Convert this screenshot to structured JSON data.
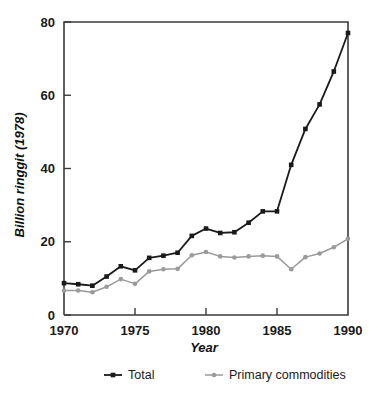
{
  "chart_data": {
    "type": "line",
    "title": "",
    "subtitle": "",
    "xlabel": "Year",
    "ylabel": "Billion ringgit (1978)",
    "xlim": [
      1970,
      1990
    ],
    "ylim": [
      0,
      80
    ],
    "xticks": [
      1970,
      1975,
      1980,
      1985,
      1990
    ],
    "yticks": [
      0,
      20,
      40,
      60,
      80
    ],
    "xtick_labels": [
      "1970",
      "1975",
      "1980",
      "1985",
      "1990"
    ],
    "ytick_labels": [
      "0",
      "20",
      "40",
      "60",
      "80"
    ],
    "grid": false,
    "legend_position": "bottom",
    "x": [
      1970,
      1971,
      1972,
      1973,
      1974,
      1975,
      1976,
      1977,
      1978,
      1979,
      1980,
      1981,
      1982,
      1983,
      1984,
      1985,
      1986,
      1987,
      1988,
      1989,
      1990
    ],
    "series": [
      {
        "name": "Total",
        "color": "#1a1a1a",
        "marker": "square",
        "values": [
          8.7,
          8.4,
          8.0,
          10.5,
          13.3,
          12.2,
          15.6,
          16.2,
          17.0,
          21.6,
          23.6,
          22.4,
          22.6,
          25.2,
          28.3,
          28.3,
          41.0,
          50.8,
          57.5,
          66.5,
          77.0
        ]
      },
      {
        "name": "Primary commodities",
        "color": "#9a9a9a",
        "marker": "circle",
        "values": [
          6.7,
          6.7,
          6.2,
          7.7,
          9.8,
          8.5,
          11.9,
          12.5,
          12.6,
          16.3,
          17.2,
          16.0,
          15.7,
          16.0,
          16.2,
          16.0,
          12.5,
          15.8,
          16.8,
          18.5,
          20.8
        ]
      }
    ]
  },
  "legend": {
    "entries": [
      {
        "label": "Total",
        "color": "#1a1a1a",
        "marker": "square"
      },
      {
        "label": "Primary commodities",
        "color": "#9a9a9a",
        "marker": "circle"
      }
    ]
  },
  "axis_titles": {
    "x": "Year",
    "y": "Billion ringgit (1978)"
  }
}
